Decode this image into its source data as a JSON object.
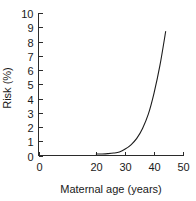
{
  "chart_data": {
    "type": "line",
    "title": "",
    "xlabel": "Maternal age (years)",
    "ylabel": "Risk (%)",
    "xlim": [
      0,
      50
    ],
    "ylim": [
      0,
      10
    ],
    "grid": false,
    "legend": "none",
    "xticks": [
      0,
      20,
      30,
      40,
      50
    ],
    "xtick_labels": [
      "0",
      "20",
      "30",
      "40",
      "50"
    ],
    "yticks": [
      0,
      1,
      2,
      3,
      4,
      5,
      6,
      7,
      8,
      9,
      10
    ],
    "ytick_labels": [
      "0",
      "1",
      "2",
      "3",
      "4",
      "5",
      "6",
      "7",
      "8",
      "9",
      "10"
    ],
    "series": [
      {
        "name": "Risk",
        "x": [
          20,
          22,
          24,
          26,
          28,
          30,
          32,
          34,
          36,
          38,
          40,
          42,
          44
        ],
        "values": [
          0.1,
          0.11,
          0.13,
          0.17,
          0.25,
          0.45,
          0.75,
          1.2,
          1.9,
          2.9,
          4.4,
          6.3,
          8.7
        ]
      }
    ]
  },
  "axes": {
    "y_title": "Risk (%)",
    "x_title": "Maternal age (years)",
    "y_labels": [
      {
        "value": 10,
        "text": "10"
      },
      {
        "value": 9,
        "text": "9"
      },
      {
        "value": 8,
        "text": "8"
      },
      {
        "value": 7,
        "text": "7"
      },
      {
        "value": 6,
        "text": "6"
      },
      {
        "value": 5,
        "text": "5"
      },
      {
        "value": 4,
        "text": "4"
      },
      {
        "value": 3,
        "text": "3"
      },
      {
        "value": 2,
        "text": "2"
      },
      {
        "value": 1,
        "text": "1"
      },
      {
        "value": 0,
        "text": "0"
      }
    ],
    "x_labels": [
      {
        "value": 0,
        "text": "0"
      },
      {
        "value": 20,
        "text": "20"
      },
      {
        "value": 30,
        "text": "30"
      },
      {
        "value": 40,
        "text": "40"
      },
      {
        "value": 50,
        "text": "50"
      }
    ]
  },
  "colors": {
    "curve": "#1c1c1c",
    "axis": "#2b2b2b",
    "text": "#1a1a1a",
    "background": "#ffffff"
  }
}
